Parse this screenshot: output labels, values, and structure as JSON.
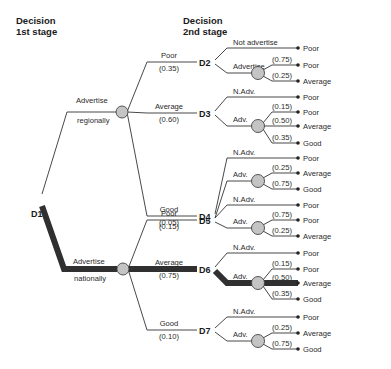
{
  "headers": {
    "stage1": [
      "Decision",
      "1st stage"
    ],
    "stage2": [
      "Decision",
      "2nd stage"
    ]
  },
  "root": {
    "id": "D1"
  },
  "first_stage": [
    {
      "label": [
        "Advertise",
        "regionally"
      ],
      "optimal": false,
      "branches": [
        {
          "state": "Poor",
          "prob": "(0.35)",
          "node": "D2",
          "optimal": false,
          "no_adv_label": "Not advertise",
          "adv_label": "Advertise",
          "no_adv_outcome": "Poor",
          "adv_outcomes": [
            {
              "prob": "(0.75)",
              "result": "Poor"
            },
            {
              "prob": "(0.25)",
              "result": "Average"
            }
          ]
        },
        {
          "state": "Average",
          "prob": "(0.60)",
          "node": "D3",
          "optimal": false,
          "no_adv_label": "N.Adv.",
          "adv_label": "Adv.",
          "no_adv_outcome": "Poor",
          "adv_outcomes": [
            {
              "prob": "(0.15)",
              "result": "Poor"
            },
            {
              "prob": "(0.50)",
              "result": "Average"
            },
            {
              "prob": "(0.35)",
              "result": "Good"
            }
          ]
        },
        {
          "state": "Good",
          "prob": "(0.05)",
          "node": "D4",
          "optimal": false,
          "no_adv_label": "N.Adv.",
          "adv_label": "Adv.",
          "no_adv_outcome": "Poor",
          "adv_outcomes": [
            {
              "prob": "(0.25)",
              "result": "Average"
            },
            {
              "prob": "(0.75)",
              "result": "Good"
            }
          ]
        }
      ]
    },
    {
      "label": [
        "Advertise",
        "nationally"
      ],
      "optimal": true,
      "branches": [
        {
          "state": "Poor",
          "prob": "(0.15)",
          "node": "D5",
          "optimal": false,
          "no_adv_label": "N.Adv.",
          "adv_label": "Adv.",
          "no_adv_outcome": "Poor",
          "adv_outcomes": [
            {
              "prob": "(0.75)",
              "result": "Poor"
            },
            {
              "prob": "(0.25)",
              "result": "Average"
            }
          ]
        },
        {
          "state": "Average",
          "prob": "(0.75)",
          "node": "D6",
          "optimal": true,
          "no_adv_label": "N.Adv.",
          "adv_label": "Adv.",
          "no_adv_outcome": "Poor",
          "adv_outcomes": [
            {
              "prob": "(0.15)",
              "result": "Poor"
            },
            {
              "prob": "(0.50)",
              "result": "Average",
              "optimal": true
            },
            {
              "prob": "(0.35)",
              "result": "Good"
            }
          ]
        },
        {
          "state": "Good",
          "prob": "(0.10)",
          "node": "D7",
          "optimal": false,
          "no_adv_label": "N.Adv.",
          "adv_label": "Adv.",
          "no_adv_outcome": "Poor",
          "adv_outcomes": [
            {
              "prob": "(0.25)",
              "result": "Average"
            },
            {
              "prob": "(0.75)",
              "result": "Good"
            }
          ]
        }
      ]
    }
  ],
  "colors": {
    "line": "#333333",
    "optimal_path": "#303030",
    "chance_node_fill": "#c4c4c4",
    "background": "#ffffff"
  }
}
